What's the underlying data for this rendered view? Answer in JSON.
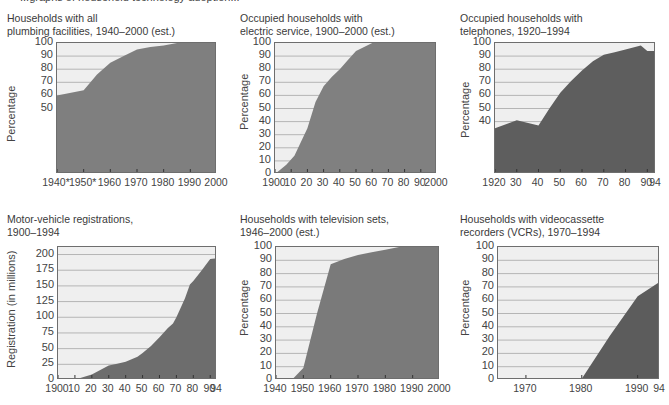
{
  "page": {
    "header_fragment": "...graphs of household technology adoption..."
  },
  "chart_data": [
    {
      "id": "plumbing",
      "type": "area",
      "title": "Households with all plumbing facilities, 1940–2000 (est.)",
      "title_lines": [
        "Households with all",
        "plumbing facilities, 1940–2000 (est.)"
      ],
      "xlabel": "",
      "ylabel": "Percentage",
      "ylim": [
        0,
        100
      ],
      "yticks": [
        50,
        60,
        70,
        80,
        90,
        100
      ],
      "xlim": [
        1940,
        2000
      ],
      "xtick_labels": [
        {
          "x": 1940,
          "label": "1940*"
        },
        {
          "x": 1950,
          "label": "1950*"
        },
        {
          "x": 1960,
          "label": "1960"
        },
        {
          "x": 1970,
          "label": "1970"
        },
        {
          "x": 1980,
          "label": "1980"
        },
        {
          "x": 1990,
          "label": "1990"
        },
        {
          "x": 2000,
          "label": "2000"
        }
      ],
      "grid": true,
      "fill_color": "#7f7f7f",
      "x": [
        1940,
        1950,
        1955,
        1960,
        1965,
        1970,
        1975,
        1980,
        1985,
        1990,
        2000
      ],
      "y": [
        60,
        64,
        76,
        85,
        90,
        95,
        97,
        98,
        100,
        100,
        100
      ]
    },
    {
      "id": "electric",
      "type": "area",
      "title": "Occupied households with electric service, 1900–2000 (est.)",
      "title_lines": [
        "Occupied households with",
        "electric service, 1900–2000 (est.)"
      ],
      "xlabel": "",
      "ylabel": "Percentage",
      "ylim": [
        0,
        100
      ],
      "yticks": [
        0,
        10,
        20,
        30,
        40,
        50,
        60,
        70,
        80,
        90,
        100
      ],
      "xlim": [
        1900,
        2000
      ],
      "xtick_labels": [
        {
          "x": 1900,
          "label": "1900"
        },
        {
          "x": 1910,
          "label": "10"
        },
        {
          "x": 1920,
          "label": "20"
        },
        {
          "x": 1930,
          "label": "30"
        },
        {
          "x": 1940,
          "label": "40"
        },
        {
          "x": 1950,
          "label": "50"
        },
        {
          "x": 1960,
          "label": "60"
        },
        {
          "x": 1970,
          "label": "70"
        },
        {
          "x": 1980,
          "label": "80"
        },
        {
          "x": 1990,
          "label": "90"
        },
        {
          "x": 2000,
          "label": "2000"
        }
      ],
      "grid": true,
      "fill_color": "#808080",
      "x": [
        1900,
        1907,
        1912,
        1920,
        1925,
        1930,
        1935,
        1940,
        1945,
        1950,
        1955,
        1960,
        2000
      ],
      "y": [
        0,
        7,
        14,
        35,
        55,
        67,
        74,
        80,
        87,
        94,
        97,
        100,
        100
      ]
    },
    {
      "id": "telephones",
      "type": "area",
      "title": "Occupied households with telephones, 1920–1994",
      "title_lines": [
        "Occupied households with",
        "telephones, 1920–1994"
      ],
      "xlabel": "",
      "ylabel": "Percentage",
      "ylim": [
        0,
        100
      ],
      "yticks": [
        40,
        50,
        60,
        70,
        80,
        90,
        100
      ],
      "xlim": [
        1920,
        1994
      ],
      "xtick_labels": [
        {
          "x": 1920,
          "label": "1920"
        },
        {
          "x": 1930,
          "label": "30"
        },
        {
          "x": 1940,
          "label": "40"
        },
        {
          "x": 1950,
          "label": "50"
        },
        {
          "x": 1960,
          "label": "60"
        },
        {
          "x": 1970,
          "label": "70"
        },
        {
          "x": 1980,
          "label": "80"
        },
        {
          "x": 1990,
          "label": "90"
        },
        {
          "x": 1994,
          "label": "94"
        }
      ],
      "grid": true,
      "fill_color": "#5e5e5e",
      "x": [
        1920,
        1930,
        1940,
        1945,
        1950,
        1955,
        1960,
        1965,
        1970,
        1975,
        1980,
        1987,
        1990,
        1994
      ],
      "y": [
        35,
        41,
        37,
        50,
        62,
        71,
        79,
        86,
        91,
        93,
        95,
        98,
        94,
        94
      ]
    },
    {
      "id": "motor_vehicles",
      "type": "area",
      "title": "Motor-vehicle registrations, 1900–1994",
      "title_lines": [
        "Motor-vehicle registrations,",
        "1900–1994"
      ],
      "xlabel": "",
      "ylabel": "Registration (in millions)",
      "ylim": [
        0,
        212
      ],
      "yticks": [
        0,
        25,
        50,
        75,
        100,
        125,
        150,
        175,
        200
      ],
      "xlim": [
        1900,
        1994
      ],
      "xtick_labels": [
        {
          "x": 1900,
          "label": "1900"
        },
        {
          "x": 1910,
          "label": "10"
        },
        {
          "x": 1920,
          "label": "20"
        },
        {
          "x": 1930,
          "label": "30"
        },
        {
          "x": 1940,
          "label": "40"
        },
        {
          "x": 1950,
          "label": "50"
        },
        {
          "x": 1960,
          "label": "60"
        },
        {
          "x": 1970,
          "label": "70"
        },
        {
          "x": 1980,
          "label": "80"
        },
        {
          "x": 1990,
          "label": "90"
        },
        {
          "x": 1994,
          "label": "94"
        }
      ],
      "grid": true,
      "fill_color": "#6d6d6d",
      "x": [
        1900,
        1910,
        1920,
        1930,
        1935,
        1940,
        1947,
        1950,
        1955,
        1960,
        1965,
        1968,
        1970,
        1975,
        1978,
        1980,
        1985,
        1990,
        1994
      ],
      "y": [
        0,
        0.5,
        9,
        23,
        26,
        29,
        37,
        43,
        54,
        68,
        83,
        90,
        100,
        130,
        152,
        158,
        175,
        193,
        194
      ]
    },
    {
      "id": "television",
      "type": "area",
      "title": "Households with television sets, 1946–2000 (est.)",
      "title_lines": [
        "Households with television sets,",
        "1946–2000 (est.)"
      ],
      "xlabel": "",
      "ylabel": "Percentage",
      "ylim": [
        0,
        100
      ],
      "yticks": [
        0,
        10,
        20,
        30,
        40,
        50,
        60,
        70,
        80,
        90,
        100
      ],
      "xlim": [
        1940,
        2000
      ],
      "xtick_labels": [
        {
          "x": 1940,
          "label": "1940"
        },
        {
          "x": 1950,
          "label": "1950"
        },
        {
          "x": 1960,
          "label": "1960"
        },
        {
          "x": 1970,
          "label": "1970"
        },
        {
          "x": 1980,
          "label": "1980"
        },
        {
          "x": 1990,
          "label": "1990"
        },
        {
          "x": 2000,
          "label": "2000"
        }
      ],
      "grid": true,
      "fill_color": "#7a7a7a",
      "x": [
        1940,
        1946,
        1950,
        1955,
        1960,
        1965,
        1970,
        1975,
        1980,
        1985,
        2000
      ],
      "y": [
        0,
        0.5,
        9,
        50,
        87,
        91,
        94,
        96,
        98,
        100,
        100
      ]
    },
    {
      "id": "vcr",
      "type": "area",
      "title": "Households with videocassette recorders (VCRs), 1970–1994",
      "title_lines": [
        "Households with videocassette",
        "recorders (VCRs), 1970–1994"
      ],
      "xlabel": "",
      "ylabel": "Percentage",
      "ylim": [
        0,
        100
      ],
      "yticks": [
        0,
        10,
        20,
        30,
        40,
        50,
        60,
        70,
        80,
        90,
        100
      ],
      "xlim": [
        1965,
        1994
      ],
      "xtick_labels": [
        {
          "x": 1970,
          "label": "1970"
        },
        {
          "x": 1980,
          "label": "1980"
        },
        {
          "x": 1990,
          "label": "1990"
        },
        {
          "x": 1994,
          "label": "94"
        }
      ],
      "grid": true,
      "fill_color": "#5c5c5c",
      "x": [
        1965,
        1970,
        1980,
        1985,
        1990,
        1994
      ],
      "y": [
        0,
        0,
        1,
        33,
        63,
        74
      ]
    }
  ],
  "layout": [
    {
      "title_left": 7,
      "title_top": 12,
      "plot": {
        "left": 56,
        "top": 42,
        "width": 160,
        "height": 131
      },
      "ylabel_left": 5,
      "ylabel_top": 142
    },
    {
      "title_left": 240,
      "title_top": 12,
      "plot": {
        "left": 274,
        "top": 42,
        "width": 162,
        "height": 131
      },
      "ylabel_left": 238,
      "ylabel_top": 130
    },
    {
      "title_left": 460,
      "title_top": 12,
      "plot": {
        "left": 494,
        "top": 42,
        "width": 161,
        "height": 131
      },
      "ylabel_left": 459,
      "ylabel_top": 138
    },
    {
      "title_left": 7,
      "title_top": 213,
      "plot": {
        "left": 57,
        "top": 246,
        "width": 159,
        "height": 133
      },
      "ylabel_left": 5,
      "ylabel_top": 368
    },
    {
      "title_left": 240,
      "title_top": 213,
      "plot": {
        "left": 275,
        "top": 246,
        "width": 164,
        "height": 133
      },
      "ylabel_left": 238,
      "ylabel_top": 336
    },
    {
      "title_left": 460,
      "title_top": 213,
      "plot": {
        "left": 497,
        "top": 246,
        "width": 162,
        "height": 133
      },
      "ylabel_left": 459,
      "ylabel_top": 336
    }
  ]
}
